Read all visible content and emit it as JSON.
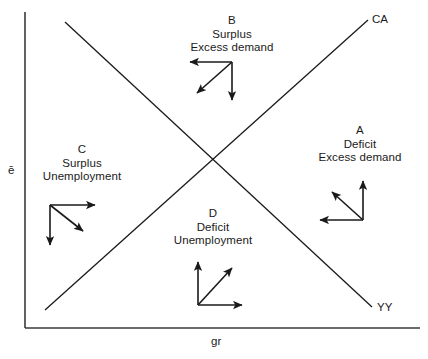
{
  "figure": {
    "type": "diagram",
    "background": "#ffffff",
    "ink_color": "#1a1a1a",
    "width": 428,
    "height": 359
  },
  "axes": {
    "y_label": "ē",
    "x_label": "gr",
    "origin": {
      "x": 25,
      "y": 328
    },
    "y_top": {
      "x": 25,
      "y": 12
    },
    "x_right": {
      "x": 420,
      "y": 328
    }
  },
  "curves": [
    {
      "name": "CA",
      "label": "CA",
      "slope": "upward",
      "from": {
        "x": 45,
        "y": 310
      },
      "to": {
        "x": 368,
        "y": 20
      },
      "label_pos": {
        "x": 372,
        "y": 13
      }
    },
    {
      "name": "YY",
      "label": "YY",
      "slope": "downward",
      "from": {
        "x": 65,
        "y": 22
      },
      "to": {
        "x": 372,
        "y": 307
      },
      "label_pos": {
        "x": 377,
        "y": 301
      }
    }
  ],
  "intersection": {
    "x": 212,
    "y": 155
  },
  "quadrants": [
    {
      "id": "A",
      "letter": "A",
      "line1": "Deficit",
      "line2": "Excess demand",
      "text_center": {
        "x": 360,
        "y": 124
      },
      "arrow_origin": {
        "x": 363,
        "y": 220
      },
      "arrows": [
        {
          "name": "up",
          "dx": 0,
          "dy": -39
        },
        {
          "name": "up-left-diagonal",
          "dx": -31,
          "dy": -28
        },
        {
          "name": "left",
          "dx": -43,
          "dy": 0
        }
      ]
    },
    {
      "id": "B",
      "letter": "B",
      "line1": "Surplus",
      "line2": "Excess demand",
      "text_center": {
        "x": 232,
        "y": 14
      },
      "arrow_origin": {
        "x": 232,
        "y": 62
      },
      "arrows": [
        {
          "name": "left",
          "dx": -42,
          "dy": 0
        },
        {
          "name": "down-left-diagonal",
          "dx": -35,
          "dy": 31
        },
        {
          "name": "down",
          "dx": 0,
          "dy": 38
        }
      ]
    },
    {
      "id": "C",
      "letter": "C",
      "line1": "Surplus",
      "line2": "Unemployment",
      "text_center": {
        "x": 82,
        "y": 143
      },
      "arrow_origin": {
        "x": 50,
        "y": 205
      },
      "arrows": [
        {
          "name": "right",
          "dx": 45,
          "dy": 0
        },
        {
          "name": "down-right-diagonal",
          "dx": 33,
          "dy": 26
        },
        {
          "name": "down",
          "dx": 0,
          "dy": 40
        }
      ]
    },
    {
      "id": "D",
      "letter": "D",
      "line1": "Deficit",
      "line2": "Unemployment",
      "text_center": {
        "x": 213,
        "y": 207
      },
      "arrow_origin": {
        "x": 198,
        "y": 305
      },
      "arrows": [
        {
          "name": "up",
          "dx": 0,
          "dy": -43
        },
        {
          "name": "up-right-diagonal",
          "dx": 34,
          "dy": -37
        },
        {
          "name": "right",
          "dx": 44,
          "dy": 0
        }
      ]
    }
  ]
}
